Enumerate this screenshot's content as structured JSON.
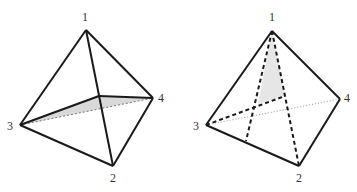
{
  "figures": [
    {
      "id": "left",
      "description": "Tetrahedron with shaded interior triangle (3-P-4) and dotted hidden edge 3-4",
      "vertices": {
        "1": {
          "x": 86,
          "y": 30,
          "label": "1",
          "lx": 85,
          "ly": 21
        },
        "2": {
          "x": 113,
          "y": 166,
          "label": "2",
          "lx": 113,
          "ly": 182
        },
        "3": {
          "x": 20,
          "y": 125,
          "label": "3",
          "lx": 10,
          "ly": 130
        },
        "4": {
          "x": 153,
          "y": 98,
          "label": "4",
          "lx": 161,
          "ly": 102
        }
      },
      "interior_point": {
        "x": 99,
        "y": 96
      },
      "shade_color": "#d9d9d9"
    },
    {
      "id": "right",
      "description": "Tetrahedron with dashed hidden edges and shaded sliver near vertex 1",
      "vertices": {
        "1": {
          "x": 272,
          "y": 31,
          "label": "1",
          "lx": 272,
          "ly": 21
        },
        "2": {
          "x": 299,
          "y": 166,
          "label": "2",
          "lx": 299,
          "ly": 182
        },
        "3": {
          "x": 206,
          "y": 125,
          "label": "3",
          "lx": 196,
          "ly": 130
        },
        "4": {
          "x": 340,
          "y": 99,
          "label": "4",
          "lx": 347,
          "ly": 102
        }
      },
      "interior_point": {
        "x": 285,
        "y": 96
      },
      "shade_color": "#e6e6e6"
    }
  ],
  "labels": {
    "left_v1": "1",
    "left_v2": "2",
    "left_v3": "3",
    "left_v4": "4",
    "right_v1": "1",
    "right_v2": "2",
    "right_v3": "3",
    "right_v4": "4"
  },
  "colors": {
    "stroke": "#1a1a1a",
    "dotted": "#777777",
    "label": "#333333"
  }
}
